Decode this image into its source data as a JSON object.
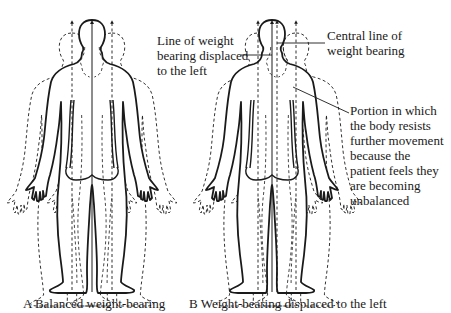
{
  "figure_a": {
    "caption": "A Balanced weight-bearing"
  },
  "figure_b": {
    "caption": "B Weight-bearing displaced to the left",
    "annotations": {
      "displaced_line": [
        "Line of weight",
        "bearing displaced",
        "to the left"
      ],
      "central_line": [
        "Central line of",
        "weight bearing"
      ],
      "resist_portion": [
        "Portion in which",
        "the body resists",
        "further movement",
        "because the",
        "patient feels they",
        "are becoming",
        "unbalanced"
      ]
    }
  },
  "colors": {
    "ink": "#1a1a1a",
    "background": "#ffffff"
  }
}
